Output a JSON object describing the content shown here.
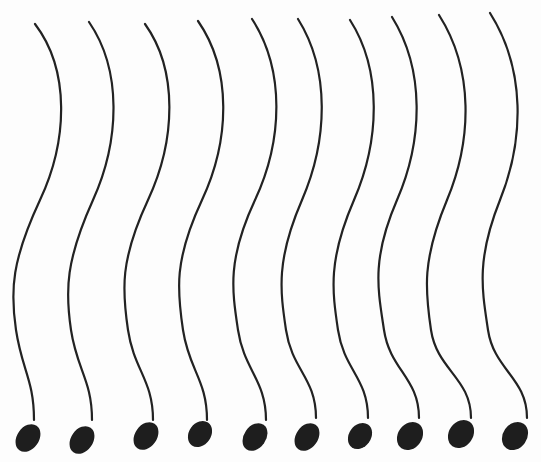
{
  "drawing": {
    "description": "Ten wavy vertical strands, each ending in a filled blob at the bottom",
    "background": "#fdfdfd",
    "stroke_color": "#222222",
    "fill_color": "#1e1e1e",
    "strands": [
      {
        "top": [
          35,
          24
        ],
        "c1": [
          70,
          70
        ],
        "mid": [
          40,
          200
        ],
        "c2": [
          10,
          330
        ],
        "stem": [
          34,
          420
        ],
        "head": [
          28,
          438,
          11,
          15,
          35
        ]
      },
      {
        "top": [
          89,
          22
        ],
        "c1": [
          122,
          70
        ],
        "mid": [
          93,
          200
        ],
        "c2": [
          65,
          330
        ],
        "stem": [
          92,
          420
        ],
        "head": [
          82,
          440,
          11,
          15,
          35
        ]
      },
      {
        "top": [
          145,
          24
        ],
        "c1": [
          178,
          70
        ],
        "mid": [
          148,
          200
        ],
        "c2": [
          122,
          330
        ],
        "stem": [
          153,
          420
        ],
        "head": [
          146,
          436,
          11,
          15,
          35
        ]
      },
      {
        "top": [
          198,
          21
        ],
        "c1": [
          232,
          70
        ],
        "mid": [
          202,
          200
        ],
        "c2": [
          177,
          330
        ],
        "stem": [
          207,
          420
        ],
        "head": [
          200,
          434,
          11,
          14,
          35
        ]
      },
      {
        "top": [
          252,
          19
        ],
        "c1": [
          285,
          70
        ],
        "mid": [
          255,
          200
        ],
        "c2": [
          232,
          330
        ],
        "stem": [
          266,
          420
        ],
        "head": [
          255,
          437,
          11,
          15,
          35
        ]
      },
      {
        "top": [
          298,
          19
        ],
        "c1": [
          330,
          70
        ],
        "mid": [
          302,
          200
        ],
        "c2": [
          280,
          330
        ],
        "stem": [
          316,
          418
        ],
        "head": [
          307,
          437,
          11,
          15,
          35
        ]
      },
      {
        "top": [
          350,
          20
        ],
        "c1": [
          382,
          70
        ],
        "mid": [
          354,
          200
        ],
        "c2": [
          332,
          330
        ],
        "stem": [
          368,
          418
        ],
        "head": [
          360,
          436,
          11,
          14,
          35
        ]
      },
      {
        "top": [
          392,
          17
        ],
        "c1": [
          425,
          70
        ],
        "mid": [
          397,
          200
        ],
        "c2": [
          378,
          330
        ],
        "stem": [
          419,
          418
        ],
        "head": [
          410,
          436,
          12,
          15,
          35
        ]
      },
      {
        "top": [
          439,
          15
        ],
        "c1": [
          474,
          70
        ],
        "mid": [
          447,
          200
        ],
        "c2": [
          425,
          330
        ],
        "stem": [
          471,
          418
        ],
        "head": [
          461,
          434,
          12,
          15,
          35
        ]
      },
      {
        "top": [
          490,
          13
        ],
        "c1": [
          526,
          70
        ],
        "mid": [
          500,
          200
        ],
        "c2": [
          482,
          330
        ],
        "stem": [
          527,
          418
        ],
        "head": [
          515,
          436,
          12,
          15,
          35
        ]
      }
    ]
  }
}
